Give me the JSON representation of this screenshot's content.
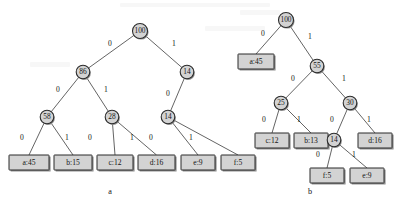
{
  "figure": {
    "title": "",
    "background_color": "#ffffff",
    "node_fill": "#d3d3d3",
    "node_stroke": "#2b2b2b",
    "edge_color": "#3c3c3c",
    "text_color": "#141414"
  },
  "trees": [
    {
      "id": "tree-a",
      "caption": "a",
      "caption_x": 110,
      "caption_y": 192,
      "nodes": [
        {
          "id": "a-root",
          "label": "100",
          "x": 140,
          "y": 31,
          "r": 7.5,
          "kind": "internal"
        },
        {
          "id": "a-n86",
          "label": "86",
          "x": 83,
          "y": 72,
          "r": 6.8,
          "kind": "internal"
        },
        {
          "id": "a-n14r",
          "label": "14",
          "x": 187,
          "y": 72,
          "r": 6.8,
          "kind": "internal"
        },
        {
          "id": "a-n58",
          "label": "58",
          "x": 47,
          "y": 117,
          "r": 6.8,
          "kind": "internal"
        },
        {
          "id": "a-n28",
          "label": "28",
          "x": 112,
          "y": 117,
          "r": 6.8,
          "kind": "internal"
        },
        {
          "id": "a-n14b",
          "label": "14",
          "x": 168,
          "y": 117,
          "r": 6.8,
          "kind": "internal"
        }
      ],
      "leaves": [
        {
          "id": "a-leaf-a",
          "label": "a:45",
          "x": 9,
          "y": 155,
          "w": 40,
          "h": 15
        },
        {
          "id": "a-leaf-b",
          "label": "b:15",
          "x": 54,
          "y": 155,
          "w": 38,
          "h": 15
        },
        {
          "id": "a-leaf-c",
          "label": "c:12",
          "x": 97,
          "y": 155,
          "w": 36,
          "h": 15
        },
        {
          "id": "a-leaf-d",
          "label": "d:16",
          "x": 138,
          "y": 155,
          "w": 37,
          "h": 15
        },
        {
          "id": "a-leaf-e",
          "label": "e:9",
          "x": 181,
          "y": 155,
          "w": 34,
          "h": 15
        },
        {
          "id": "a-leaf-f",
          "label": "f:5",
          "x": 221,
          "y": 155,
          "w": 34,
          "h": 15
        }
      ],
      "edges": [
        {
          "from": "a-root",
          "to": "a-n86",
          "bit": "0",
          "lx": 110,
          "ly": 44
        },
        {
          "from": "a-root",
          "to": "a-n14r",
          "bit": "1",
          "lx": 174,
          "ly": 44
        },
        {
          "from": "a-n86",
          "to": "a-n58",
          "bit": "0",
          "lx": 58,
          "ly": 90
        },
        {
          "from": "a-n86",
          "to": "a-n28",
          "bit": "1",
          "lx": 106,
          "ly": 90
        },
        {
          "from": "a-n14r",
          "to": "a-n14b",
          "bit": "0",
          "lx": 168,
          "ly": 94
        },
        {
          "from": "a-n58",
          "to": "a-leaf-a",
          "bit": "0",
          "lx": 22,
          "ly": 138
        },
        {
          "from": "a-n58",
          "to": "a-leaf-b",
          "bit": "1",
          "lx": 67,
          "ly": 138
        },
        {
          "from": "a-n28",
          "to": "a-leaf-c",
          "bit": "0",
          "lx": 90,
          "ly": 138
        },
        {
          "from": "a-n28",
          "to": "a-leaf-d",
          "bit": "1",
          "lx": 132,
          "ly": 138
        },
        {
          "from": "a-n14b",
          "to": "a-leaf-e",
          "bit": "0",
          "lx": 151,
          "ly": 138
        },
        {
          "from": "a-n14b",
          "to": "a-leaf-f",
          "bit": "1",
          "lx": 191,
          "ly": 138
        }
      ]
    },
    {
      "id": "tree-b",
      "caption": "b",
      "caption_x": 310,
      "caption_y": 192,
      "nodes": [
        {
          "id": "b-root",
          "label": "100",
          "x": 286,
          "y": 20,
          "r": 7.5,
          "kind": "internal"
        },
        {
          "id": "b-n55",
          "label": "55",
          "x": 317,
          "y": 66,
          "r": 6.8,
          "kind": "internal"
        },
        {
          "id": "b-n25",
          "label": "25",
          "x": 281,
          "y": 103,
          "r": 6.8,
          "kind": "internal"
        },
        {
          "id": "b-n30",
          "label": "30",
          "x": 350,
          "y": 103,
          "r": 6.8,
          "kind": "internal"
        },
        {
          "id": "b-n14",
          "label": "14",
          "x": 334,
          "y": 140,
          "r": 6.8,
          "kind": "internal"
        }
      ],
      "leaves": [
        {
          "id": "b-leaf-a",
          "label": "a:45",
          "x": 238,
          "y": 54,
          "w": 36,
          "h": 15
        },
        {
          "id": "b-leaf-c",
          "label": "c:12",
          "x": 255,
          "y": 133,
          "w": 34,
          "h": 15
        },
        {
          "id": "b-leaf-b",
          "label": "b:13",
          "x": 294,
          "y": 133,
          "w": 34,
          "h": 15
        },
        {
          "id": "b-leaf-d",
          "label": "d:16",
          "x": 358,
          "y": 133,
          "w": 34,
          "h": 15
        },
        {
          "id": "b-leaf-f",
          "label": "f:5",
          "x": 310,
          "y": 168,
          "w": 34,
          "h": 15
        },
        {
          "id": "b-leaf-e",
          "label": "e:9",
          "x": 350,
          "y": 168,
          "w": 34,
          "h": 15
        }
      ],
      "edges": [
        {
          "from": "b-root",
          "to": "b-leaf-a",
          "bit": "0",
          "lx": 263,
          "ly": 34
        },
        {
          "from": "b-root",
          "to": "b-n55",
          "bit": "1",
          "lx": 310,
          "ly": 37
        },
        {
          "from": "b-n55",
          "to": "b-n25",
          "bit": "0",
          "lx": 293,
          "ly": 79
        },
        {
          "from": "b-n55",
          "to": "b-n30",
          "bit": "1",
          "lx": 344,
          "ly": 79
        },
        {
          "from": "b-n25",
          "to": "b-leaf-c",
          "bit": "0",
          "lx": 264,
          "ly": 120
        },
        {
          "from": "b-n25",
          "to": "b-leaf-b",
          "bit": "1",
          "lx": 299,
          "ly": 120
        },
        {
          "from": "b-n30",
          "to": "b-n14",
          "bit": "0",
          "lx": 332,
          "ly": 120
        },
        {
          "from": "b-n30",
          "to": "b-leaf-d",
          "bit": "1",
          "lx": 369,
          "ly": 120
        },
        {
          "from": "b-n14",
          "to": "b-leaf-f",
          "bit": "0",
          "lx": 318,
          "ly": 155
        },
        {
          "from": "b-n14",
          "to": "b-leaf-e",
          "bit": "1",
          "lx": 354,
          "ly": 155
        }
      ]
    }
  ],
  "chart_data": {
    "type": "diagram",
    "subtype": "huffman-coding-trees",
    "title": "",
    "panels": [
      {
        "caption": "a",
        "description": "Fixed-length / suboptimal prefix code tree, root weight 100",
        "internal_node_weights": [
          100,
          86,
          14,
          58,
          28,
          14
        ],
        "leaves": [
          {
            "symbol": "a",
            "frequency": 45,
            "code": "000"
          },
          {
            "symbol": "b",
            "frequency": 15,
            "code": "001"
          },
          {
            "symbol": "c",
            "frequency": 12,
            "code": "010"
          },
          {
            "symbol": "d",
            "frequency": 16,
            "code": "011"
          },
          {
            "symbol": "e",
            "frequency": 9,
            "code": "100"
          },
          {
            "symbol": "f",
            "frequency": 5,
            "code": "101"
          }
        ]
      },
      {
        "caption": "b",
        "description": "Optimal Huffman code tree, root weight 100",
        "internal_node_weights": [
          100,
          55,
          25,
          30,
          14
        ],
        "leaves": [
          {
            "symbol": "a",
            "frequency": 45,
            "code": "0"
          },
          {
            "symbol": "c",
            "frequency": 12,
            "code": "100"
          },
          {
            "symbol": "b",
            "frequency": 13,
            "code": "101"
          },
          {
            "symbol": "f",
            "frequency": 5,
            "code": "1100"
          },
          {
            "symbol": "e",
            "frequency": 9,
            "code": "1101"
          },
          {
            "symbol": "d",
            "frequency": 16,
            "code": "111"
          }
        ]
      }
    ],
    "edge_labels": [
      "0",
      "1"
    ]
  }
}
